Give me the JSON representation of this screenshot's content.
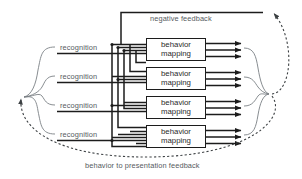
{
  "diagram": {
    "type": "block-diagram",
    "colors": {
      "line": "#1c1c1c",
      "thin_line": "#7b8084",
      "dashed": "#55595c",
      "text": "#55595c",
      "box_text": "#2a2a2a",
      "background": "#ffffff"
    },
    "top_feedback_label": "negative feedback",
    "bottom_feedback_label": "behavior to presentation feedback",
    "inputs": [
      {
        "label": "recognition"
      },
      {
        "label": "recognition"
      },
      {
        "label": "recognition"
      },
      {
        "label": "recognition"
      }
    ],
    "blocks": [
      {
        "line1": "behavior",
        "line2": "mapping"
      },
      {
        "line1": "behavior",
        "line2": "mapping"
      },
      {
        "line1": "behavior",
        "line2": "mapping"
      },
      {
        "line1": "behavior",
        "line2": "mapping"
      }
    ],
    "rows": 4,
    "outputs_per_row": 3,
    "left_brace": "input grouping brace",
    "right_brace": "output grouping brace"
  }
}
